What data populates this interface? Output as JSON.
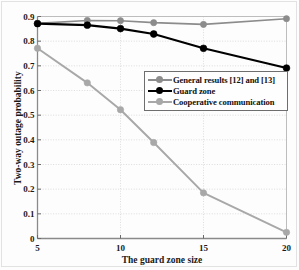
{
  "chart_data": {
    "type": "line",
    "title": "",
    "xlabel": "The guard zone size",
    "ylabel": "Two-way outage probability",
    "xlim": [
      5,
      20
    ],
    "ylim": [
      0,
      0.9
    ],
    "grid": true,
    "legend_position": "center-right",
    "xticks": [
      "5",
      "10",
      "15",
      "20"
    ],
    "xtick_values": [
      5,
      10,
      15,
      20
    ],
    "yticks": [
      "0",
      "0.1",
      "0.2",
      "0.3",
      "0.4",
      "0.5",
      "0.6",
      "0.7",
      "0.8",
      "0.9"
    ],
    "ytick_values": [
      0,
      0.1,
      0.2,
      0.3,
      0.4,
      0.5,
      0.6,
      0.7,
      0.8,
      0.9
    ],
    "x": [
      5,
      8,
      10,
      12,
      15,
      20
    ],
    "series": [
      {
        "name": "General results [12] and [13]",
        "color": "#8c8c8c",
        "marker": "circle",
        "values": [
          0.872,
          0.884,
          0.883,
          0.875,
          0.868,
          0.891
        ]
      },
      {
        "name": "Guard zone",
        "color": "#000000",
        "marker": "circle",
        "values": [
          0.871,
          0.865,
          0.851,
          0.829,
          0.771,
          0.691
        ]
      },
      {
        "name": "Cooperative communication",
        "color": "#a8a8a8",
        "marker": "circle",
        "values": [
          0.771,
          0.631,
          0.522,
          0.389,
          0.185,
          0.025
        ]
      }
    ]
  },
  "axes": {
    "xlabel": "The guard zone size",
    "ylabel": "Two-way outage probability"
  },
  "legend": {
    "items": [
      {
        "label": "General results [12] and [13]",
        "color": "#8c8c8c"
      },
      {
        "label": "Guard zone",
        "color": "#000000"
      },
      {
        "label": "Cooperative communication",
        "color": "#a8a8a8"
      }
    ]
  }
}
